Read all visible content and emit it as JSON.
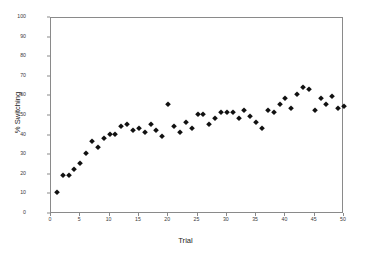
{
  "chart_data": {
    "type": "scatter",
    "title": "",
    "xlabel": "Trial",
    "ylabel": "% Switching",
    "xlim": [
      0,
      50
    ],
    "ylim": [
      0,
      100
    ],
    "xticks": [
      0,
      5,
      10,
      15,
      20,
      25,
      30,
      35,
      40,
      45,
      50
    ],
    "yticks": [
      0,
      10,
      20,
      30,
      40,
      50,
      60,
      70,
      80,
      90,
      100
    ],
    "grid": false,
    "legend": null,
    "marker": "diamond",
    "marker_color": "#111111",
    "frame_color": "#8a8a8a",
    "x": [
      1,
      2,
      3,
      4,
      5,
      6,
      7,
      8,
      9,
      10,
      11,
      12,
      13,
      14,
      15,
      16,
      17,
      18,
      19,
      20,
      21,
      22,
      23,
      24,
      25,
      26,
      27,
      28,
      29,
      30,
      31,
      32,
      33,
      34,
      35,
      36,
      37,
      38,
      39,
      40,
      41,
      42,
      43,
      44,
      45,
      46,
      47,
      48,
      49,
      50
    ],
    "y": [
      11,
      20,
      20,
      23,
      26,
      31,
      37,
      34,
      39,
      41,
      41,
      45,
      46,
      43,
      44,
      42,
      46,
      43,
      40,
      56,
      45,
      42,
      47,
      44,
      51,
      51,
      46,
      49,
      52,
      52,
      52,
      49,
      53,
      50,
      47,
      44,
      53,
      52,
      56,
      59,
      54,
      61,
      65,
      64,
      53,
      59,
      56,
      60,
      54,
      55
    ]
  }
}
